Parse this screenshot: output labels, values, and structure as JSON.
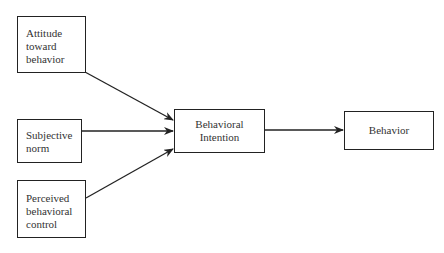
{
  "diagram": {
    "nodes": [
      {
        "id": "attitude",
        "lines": [
          "Attitude",
          "toward",
          "behavior"
        ]
      },
      {
        "id": "norm",
        "lines": [
          "Subjective",
          "norm"
        ]
      },
      {
        "id": "control",
        "lines": [
          "Perceived",
          "behavioral",
          "control"
        ]
      },
      {
        "id": "intention",
        "lines": [
          "Behavioral",
          "Intention"
        ]
      },
      {
        "id": "behavior",
        "lines": [
          "Behavior"
        ]
      }
    ],
    "edges": [
      {
        "from": "attitude",
        "to": "intention"
      },
      {
        "from": "norm",
        "to": "intention"
      },
      {
        "from": "control",
        "to": "intention"
      },
      {
        "from": "intention",
        "to": "behavior"
      }
    ]
  }
}
